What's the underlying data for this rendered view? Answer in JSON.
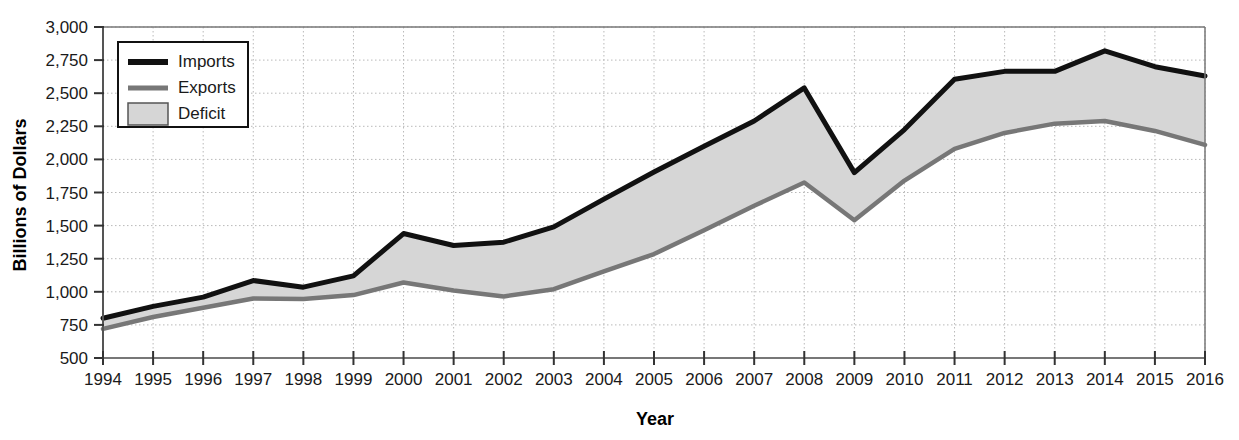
{
  "chart_data": {
    "type": "area",
    "title": "",
    "xlabel": "Year",
    "ylabel": "Billions of Dollars",
    "categories": [
      1994,
      1995,
      1996,
      1997,
      1998,
      1999,
      2000,
      2001,
      2002,
      2003,
      2004,
      2005,
      2006,
      2007,
      2008,
      2009,
      2010,
      2011,
      2012,
      2013,
      2014,
      2015,
      2016
    ],
    "series": [
      {
        "name": "Imports",
        "color": "#111111",
        "values": [
          800,
          890,
          960,
          1085,
          1035,
          1120,
          1440,
          1350,
          1375,
          1490,
          1700,
          1905,
          2100,
          2290,
          2540,
          1900,
          2225,
          2605,
          2665,
          2665,
          2820,
          2700,
          2630
        ]
      },
      {
        "name": "Exports",
        "color": "#777777",
        "values": [
          720,
          810,
          880,
          950,
          945,
          975,
          1070,
          1010,
          965,
          1020,
          1155,
          1285,
          1465,
          1650,
          1825,
          1540,
          1840,
          2080,
          2200,
          2270,
          2290,
          2215,
          2110
        ]
      }
    ],
    "fill_series": {
      "name": "Deficit",
      "color": "#d6d6d6",
      "description": "Shaded region between Imports and Exports"
    },
    "ylim": [
      500,
      3000
    ],
    "ytick_step": 250,
    "ytick_labels": [
      "500",
      "750",
      "1,000",
      "1,250",
      "1,500",
      "1,750",
      "2,000",
      "2,250",
      "2,500",
      "2,750",
      "3,000"
    ],
    "xtick_labels": [
      "1994",
      "1995",
      "1996",
      "1997",
      "1998",
      "1999",
      "2000",
      "2001",
      "2002",
      "2003",
      "2004",
      "2005",
      "2006",
      "2007",
      "2008",
      "2009",
      "2010",
      "2011",
      "2012",
      "2013",
      "2014",
      "2015",
      "2016"
    ],
    "grid": true,
    "grid_style": "dotted",
    "grid_color": "#b9b9b9",
    "legend_position": "top-left",
    "legend_entries": [
      {
        "label": "Imports",
        "marker": "line",
        "color": "#111111"
      },
      {
        "label": "Exports",
        "marker": "line",
        "color": "#777777"
      },
      {
        "label": "Deficit",
        "marker": "swatch",
        "color": "#d6d6d6"
      }
    ]
  },
  "axes": {
    "y_title": "Billions of Dollars",
    "x_title": "Year"
  },
  "colors": {
    "imports": "#111111",
    "exports": "#777777",
    "deficit_fill": "#d6d6d6",
    "axis": "#555555",
    "grid": "#b9b9b9",
    "text": "#1a1a1a",
    "background": "#ffffff"
  }
}
